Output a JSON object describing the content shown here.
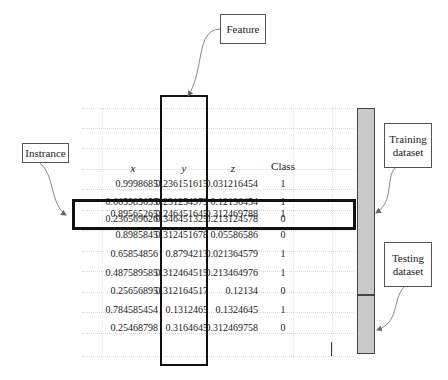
{
  "labels": {
    "feature": "Feature",
    "instance": "Instrance",
    "training": "Training dataset",
    "training_line1": "Training",
    "training_line2": "dataset",
    "testing_line1": "Testing",
    "testing_line2": "dataset"
  },
  "table": {
    "headers": [
      "x",
      "y",
      "z",
      "Class"
    ],
    "rows": [
      [
        "0.9998685",
        "0.236151615",
        "0.031216454",
        "1"
      ],
      [
        "0.665985655",
        "0.231254979",
        "0.12136454",
        "1"
      ],
      [
        "0.236569626",
        "0.346451325",
        "0.213124578",
        "0"
      ],
      [
        "0.89565265",
        "0.246451645",
        "0.312469788",
        "1"
      ],
      [
        "0.8985845",
        "0.312451678",
        "0.05586586",
        "0"
      ],
      [
        "0.65854856",
        "0.8794213",
        "0.021364579",
        "1"
      ],
      [
        "0.487589585",
        "0.312464515",
        "0.213464976",
        "1"
      ],
      [
        "0.25656895",
        "0.312164517",
        "0.12134",
        "0"
      ],
      [
        "0.784585454",
        "0.1312465",
        "0.1324645",
        "1"
      ],
      [
        "0.25468798",
        "0.3164645",
        "0.312469758",
        "0"
      ]
    ],
    "highlighted_row_index": 3,
    "highlighted_column": "y"
  },
  "colors": {
    "bar_fill": "#c9c9c9",
    "border": "#111111",
    "grid": "#d8d8d8"
  }
}
